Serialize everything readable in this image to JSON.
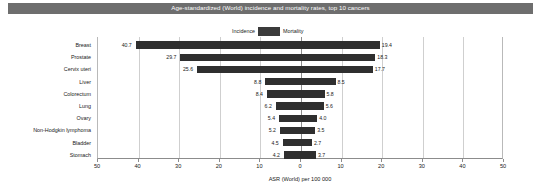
{
  "header": {
    "title": "Age-standardized (World) incidence and mortality rates, top 10 cancers"
  },
  "legend": {
    "incidence_label": "Incidence",
    "mortality_label": "Mortality",
    "swatch_color": "#3b3b3b",
    "position": "top-center"
  },
  "axis": {
    "title": "ASR (World) per 100 000",
    "ticks": [
      "50",
      "40",
      "30",
      "20",
      "10",
      "0",
      "10",
      "20",
      "30",
      "40",
      "50"
    ]
  },
  "colors": {
    "bar": "#2f2f2f",
    "title_bar": "#6e6e6e",
    "grid": "#cfcfcf",
    "axis": "#8c8c8c",
    "text": "#1a1a1a"
  },
  "chart_data": {
    "type": "bar",
    "orientation": "horizontal-diverging",
    "title": "Age-standardized (World) incidence and mortality rates, top 10 cancers",
    "xlabel": "ASR (World) per 100 000",
    "ylabel": "",
    "xlim": [
      -50,
      50
    ],
    "xticks": [
      -50,
      -40,
      -30,
      -20,
      -10,
      0,
      10,
      20,
      30,
      40,
      50
    ],
    "xticklabels": [
      "50",
      "40",
      "30",
      "20",
      "10",
      "0",
      "10",
      "20",
      "30",
      "40",
      "50"
    ],
    "grid": true,
    "legend": [
      "Incidence",
      "Mortality"
    ],
    "legend_position": "top-center",
    "categories": [
      "Breast",
      "Prostate",
      "Cervix uteri",
      "Liver",
      "Colorectum",
      "Lung",
      "Ovary",
      "Non-Hodgkin lymphoma",
      "Bladder",
      "Stomach"
    ],
    "series": [
      {
        "name": "Incidence",
        "side": "left",
        "values": [
          40.7,
          29.7,
          25.6,
          8.8,
          8.4,
          6.2,
          5.4,
          5.2,
          4.5,
          4.2
        ]
      },
      {
        "name": "Mortality",
        "side": "right",
        "values": [
          19.4,
          18.3,
          17.7,
          8.5,
          5.8,
          5.6,
          4.0,
          3.5,
          2.7,
          3.7
        ]
      }
    ]
  }
}
